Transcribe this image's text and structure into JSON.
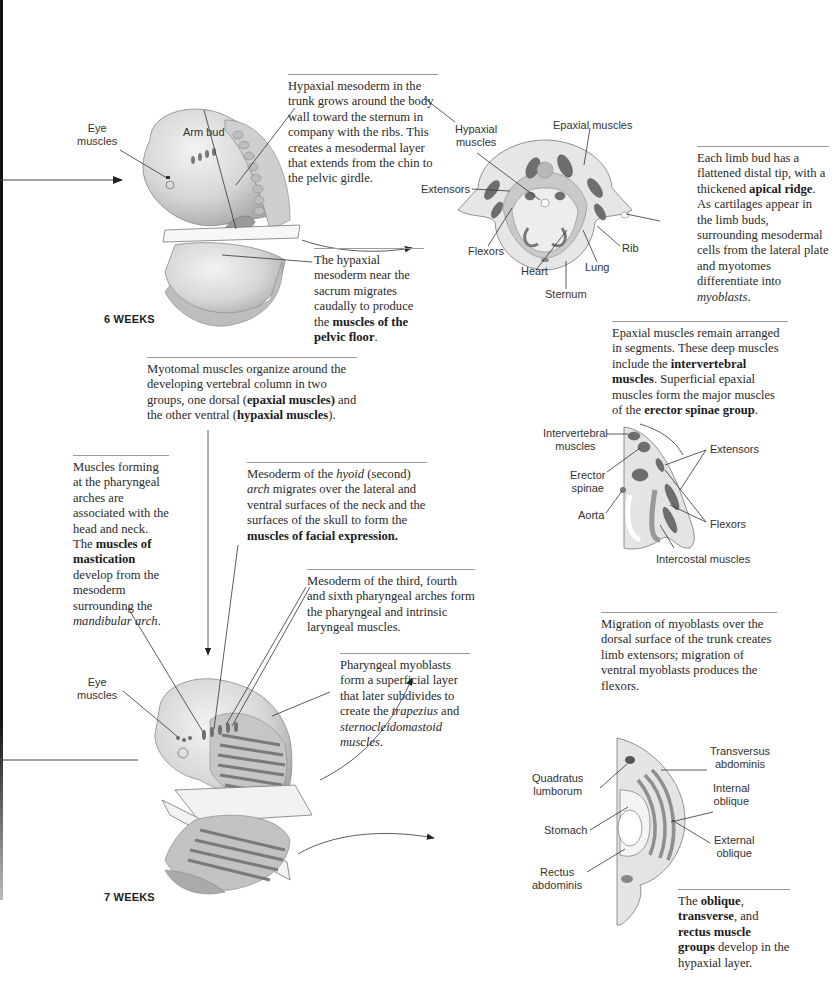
{
  "figure": {
    "stages": {
      "six_weeks": "6 WEEKS",
      "seven_weeks": "7 WEEKS"
    },
    "colors": {
      "muscle_dark": "#6e6e6e",
      "muscle_mid": "#9a9a9a",
      "tissue_light": "#d8d8d8",
      "tissue_pale": "#ececec",
      "caption_text": "#2a2a2a",
      "rule": "#9a9a9a"
    }
  },
  "captions": {
    "hypaxial_trunk": {
      "text": "Hypaxial mesoderm in the trunk grows around the body wall toward the sternum in company with the ribs. This creates a mesodermal layer that extends from the chin to the pelvic girdle."
    },
    "limb_bud": {
      "p1": "Each limb bud has a flattened distal tip, with a thickened ",
      "b1": "apical ridge",
      "p2": ". As cartilages appear in the limb buds, surrounding mesodermal cells from the lateral plate and myotomes differentiate into ",
      "i1": "myoblasts",
      "p3": "."
    },
    "sacrum": {
      "p1": "The hypaxial mesoderm near the sacrum migrates caudally to produce the ",
      "b1": "muscles of the pelvic floor",
      "p2": "."
    },
    "myotomal": {
      "p1": "Myotomal muscles organize around the developing  vertebral column in two groups, one dorsal (",
      "b1": "epaxial muscles)",
      "p2": " and the other ventral (",
      "b2": "hypaxial muscles",
      "p3": ")."
    },
    "epaxial": {
      "p1": "Epaxial muscles remain arranged in segments. These deep muscles include the ",
      "b1": "intervertebral muscles",
      "p2": ". Superficial epaxial muscles form the major muscles of the ",
      "b2": "erector spinae group",
      "p3": "."
    },
    "pharyngeal_arches": {
      "p1": "Muscles forming at the pharyngeal arches are associated with the head and neck. The ",
      "b1": "muscles of mastication",
      "p2": " develop from the mesoderm surrounding the ",
      "i1": "mandibular arch",
      "p3": "."
    },
    "hyoid": {
      "p1": "Mesoderm of the ",
      "i1": "hyoid",
      "p2": " (second) ",
      "i2": "arch",
      "p3": " migrates over the lateral and ventral surfaces of the neck and the surfaces of the skull to form the ",
      "b1": "muscles of facial expression."
    },
    "third_fourth_sixth": {
      "text": "Mesoderm of the third, fourth and sixth pharyngeal arches form the pharyngeal and intrinsic laryngeal muscles."
    },
    "pharyngeal_myoblasts": {
      "p1": "Pharyngeal myoblasts form a superficial layer that later subdivides to create the ",
      "i1": "trapezius",
      "p2": " and ",
      "i2": "sternocleidomastoid muscles",
      "p3": "."
    },
    "migration": {
      "text": "Migration of myoblasts over the dorsal surface of the trunk creates limb extensors; migration of ventral myoblasts produces the flexors."
    },
    "oblique": {
      "p0": "The ",
      "b1": "oblique",
      "p1": ", ",
      "b2": "transverse",
      "p2": ", and ",
      "b3": "rectus muscle groups",
      "p3": " develop in the hypaxial layer."
    }
  },
  "labels": {
    "embryo6": {
      "eye_muscles": "Eye\nmuscles",
      "arm_bud": "Arm bud"
    },
    "thorax_section": {
      "hypaxial_muscles": "Hypaxial\nmuscles",
      "epaxial_muscles": "Epaxial muscles",
      "extensors": "Extensors",
      "flexors": "Flexors",
      "heart": "Heart",
      "lung": "Lung",
      "rib": "Rib",
      "sternum": "Sternum"
    },
    "limb_section": {
      "intervertebral_muscles": "Intervertebral\nmuscles",
      "erector_spinae": "Erector\nspinae",
      "aorta": "Aorta",
      "extensors": "Extensors",
      "flexors": "Flexors",
      "intercostal_muscles": "Intercostal muscles"
    },
    "embryo7": {
      "eye_muscles": "Eye\nmuscles"
    },
    "abdomen_section": {
      "transversus_abdominis": "Transversus\nabdominis",
      "quadratus_lumborum": "Quadratus\nlumborum",
      "internal_oblique": "Internal\noblique",
      "stomach": "Stomach",
      "external_oblique": "External\noblique",
      "rectus_abdominis": "Rectus\nabdominis"
    }
  }
}
